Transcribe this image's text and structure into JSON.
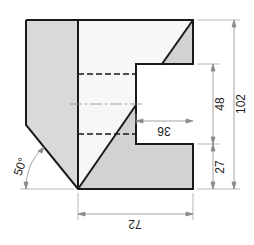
{
  "drawing": {
    "type": "technical-drawing",
    "view": "orthographic-with-hidden-lines",
    "colors": {
      "outline": "#1a1a1a",
      "shade": "#d4d4d4",
      "face": "#f6f6f6",
      "dim_line": "#8a8a8a"
    },
    "dimensions": [
      {
        "id": "height_total",
        "label": "102",
        "orientation": "vertical"
      },
      {
        "id": "notch_height",
        "label": "48",
        "orientation": "vertical"
      },
      {
        "id": "base_height",
        "label": "27",
        "orientation": "vertical"
      },
      {
        "id": "notch_depth",
        "label": "36",
        "orientation": "horizontal-inverted"
      },
      {
        "id": "width_total",
        "label": "72",
        "orientation": "horizontal-inverted"
      },
      {
        "id": "chamfer_angle",
        "label": "50°",
        "orientation": "angular"
      }
    ]
  }
}
